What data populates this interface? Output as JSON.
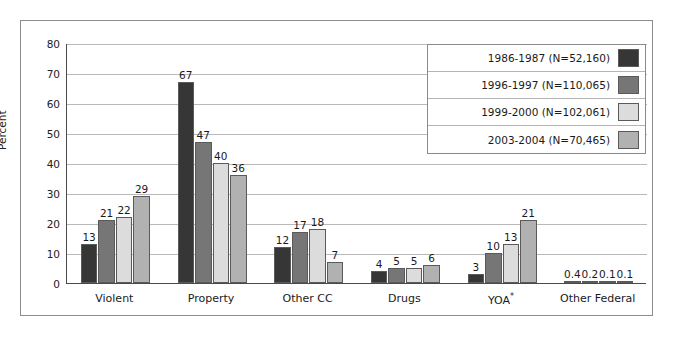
{
  "chart_data": {
    "type": "bar",
    "title": "",
    "xlabel": "",
    "ylabel": "Percent",
    "ylim": [
      0,
      80
    ],
    "yticks": [
      0,
      10,
      20,
      30,
      40,
      50,
      60,
      70,
      80
    ],
    "grid": true,
    "legend_position": "top-right",
    "categories": [
      "Violent",
      "Property",
      "Other CC",
      "Drugs",
      "YOA*",
      "Other Federal"
    ],
    "series": [
      {
        "name": "1986-1987 (N=52,160)",
        "color": "#363636",
        "values": [
          13,
          67,
          12,
          4,
          3,
          0.4
        ],
        "labels": [
          "13",
          "67",
          "12",
          "4",
          "3",
          "0.4"
        ]
      },
      {
        "name": "1996-1997 (N=110,065)",
        "color": "#767676",
        "values": [
          21,
          47,
          17,
          5,
          10,
          0.2
        ],
        "labels": [
          "21",
          "47",
          "17",
          "5",
          "10",
          "0.2"
        ]
      },
      {
        "name": "1999-2000 (N=102,061)",
        "color": "#dcdcdc",
        "values": [
          22,
          40,
          18,
          5,
          13,
          0.1
        ],
        "labels": [
          "22",
          "40",
          "18",
          "5",
          "13",
          "0.1"
        ]
      },
      {
        "name": "2003-2004 (N=70,465)",
        "color": "#b1b1b1",
        "values": [
          29,
          36,
          7,
          6,
          21,
          0.1
        ],
        "labels": [
          "29",
          "36",
          "7",
          "6",
          "21",
          "0.1"
        ]
      }
    ],
    "annotations": [
      "YOA superscript asterisk footnote marker"
    ]
  },
  "axis": {
    "y_tick_labels": [
      "0",
      "10",
      "20",
      "30",
      "40",
      "50",
      "60",
      "70",
      "80"
    ],
    "y_axis_title": "Percent"
  },
  "legend": {
    "entries": [
      {
        "label": "1986-1987 (N=52,160)",
        "color": "#363636"
      },
      {
        "label": "1996-1997 (N=110,065)",
        "color": "#767676"
      },
      {
        "label": "1999-2000 (N=102,061)",
        "color": "#dcdcdc"
      },
      {
        "label": "2003-2004 (N=70,465)",
        "color": "#b1b1b1"
      }
    ]
  },
  "categories": [
    {
      "label": "Violent",
      "star": ""
    },
    {
      "label": "Property",
      "star": ""
    },
    {
      "label": "Other CC",
      "star": ""
    },
    {
      "label": "Drugs",
      "star": ""
    },
    {
      "label": "YOA",
      "star": "*"
    },
    {
      "label": "Other Federal",
      "star": ""
    }
  ]
}
